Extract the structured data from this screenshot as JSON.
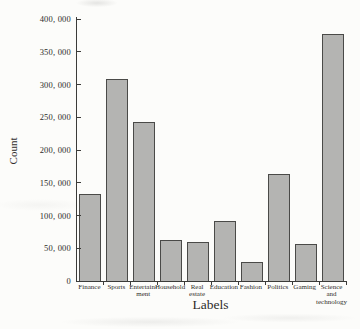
{
  "figure": {
    "background": "#fcfcfa"
  },
  "chart_data": {
    "type": "bar",
    "title": "",
    "xlabel": "Labels",
    "ylabel": "Count",
    "categories": [
      "Finance",
      "Sports",
      "Entertainment",
      "Household",
      "Real estate",
      "Education",
      "Fashion",
      "Politics",
      "Gaming",
      "Science and technology"
    ],
    "categories_display": [
      [
        "Finance"
      ],
      [
        "Sports"
      ],
      [
        "Entertain-",
        "ment"
      ],
      [
        "Household"
      ],
      [
        "Real",
        "estate"
      ],
      [
        "Education"
      ],
      [
        "Fashion"
      ],
      [
        "Politics"
      ],
      [
        "Gaming"
      ],
      [
        "Science",
        "and",
        "technology"
      ]
    ],
    "values": [
      133000,
      309000,
      243000,
      63000,
      59000,
      91000,
      29000,
      164000,
      57000,
      377000
    ],
    "ylim": [
      0,
      400000
    ],
    "yticks": [
      {
        "value": 0,
        "label": "0"
      },
      {
        "value": 50000,
        "label": "50, 000"
      },
      {
        "value": 100000,
        "label": "100, 000"
      },
      {
        "value": 150000,
        "label": "150, 000"
      },
      {
        "value": 200000,
        "label": "200, 000"
      },
      {
        "value": 250000,
        "label": "250, 000"
      },
      {
        "value": 300000,
        "label": "300, 000"
      },
      {
        "value": 350000,
        "label": "350, 000"
      },
      {
        "value": 400000,
        "label": "400, 000"
      }
    ],
    "grid": false,
    "legend_position": "none",
    "colors": {
      "bar_fill": "#b4b4b2",
      "bar_border": "#4a4a48",
      "axis": "#3b3b39",
      "text": "#2e2c2a"
    }
  }
}
